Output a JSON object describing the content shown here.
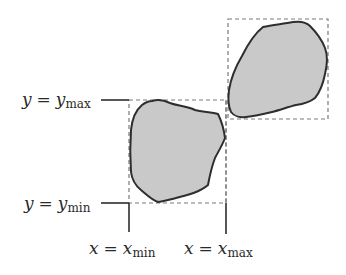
{
  "diagram": {
    "type": "bounding-box-illustration",
    "colors": {
      "shape_fill": "#c9c9c9",
      "shape_stroke": "#2e2e2e",
      "box_dash": "#7a7a7a",
      "axis_line": "#2e2e2e",
      "text": "#2a2a2a"
    },
    "labels": {
      "y_max": {
        "var": "y",
        "eq": "=",
        "base": "y",
        "sub": "max"
      },
      "y_min": {
        "var": "y",
        "eq": "=",
        "base": "y",
        "sub": "min"
      },
      "x_min": {
        "var": "x",
        "eq": "=",
        "base": "x",
        "sub": "min"
      },
      "x_max": {
        "var": "x",
        "eq": "=",
        "base": "x",
        "sub": "max"
      }
    },
    "shapes": [
      {
        "name": "lower-blob",
        "bbox": {
          "x_min": 129,
          "x_max": 226,
          "y_min": 100,
          "y_max": 203
        }
      },
      {
        "name": "upper-blob",
        "bbox": {
          "x_min": 228,
          "x_max": 328,
          "y_min": 19,
          "y_max": 119
        }
      }
    ]
  }
}
